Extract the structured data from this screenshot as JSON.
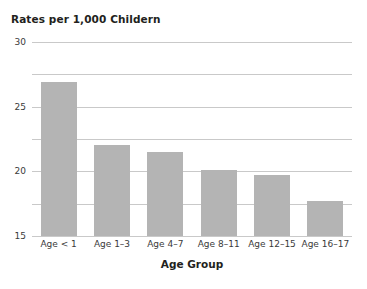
{
  "chart_data": {
    "type": "bar",
    "title": "Rates per 1,000 Childern",
    "xlabel": "Age Group",
    "ylabel": "",
    "categories": [
      "Age < 1",
      "Age 1–3",
      "Age 4–7",
      "Age 8–11",
      "Age 12–15",
      "Age 16–17"
    ],
    "values": [
      23.8,
      14.0,
      13.0,
      10.2,
      9.5,
      5.4
    ],
    "ylim": [
      0,
      30
    ],
    "yticks": [
      0,
      5,
      10,
      15,
      20,
      25,
      30
    ],
    "ytick_labels": [
      "0",
      "5",
      "10",
      "15",
      "20",
      "25",
      "30"
    ],
    "grid": true,
    "legend": "none",
    "bar_color": "#b4b4b4",
    "gridline_color": "#c9c9c9",
    "background_color": "#ffffff",
    "text_color": "#231f20"
  }
}
